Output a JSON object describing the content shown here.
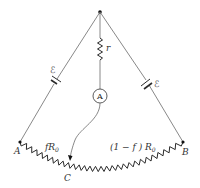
{
  "diagram": {
    "nodes": {
      "top": "",
      "A": "A",
      "B": "B",
      "C": "C"
    },
    "components": {
      "internal_resistor_label": "r",
      "ammeter_label": "A",
      "left_emf_label": "ℰ",
      "right_emf_label": "ℰ",
      "left_segment_label": "fR",
      "left_segment_sub": "0",
      "right_segment_label": "(1 − f ) R",
      "right_segment_sub": "0"
    },
    "colors": {
      "wire": "#6a6a6a",
      "resistor": "#2a2a2a",
      "background": "#ffffff"
    }
  }
}
